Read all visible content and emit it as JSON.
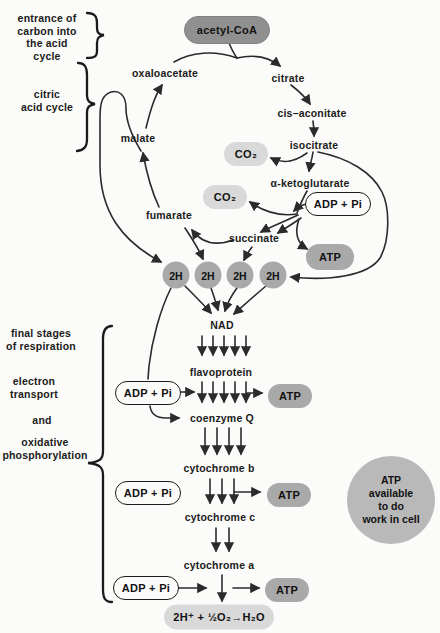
{
  "side": {
    "entrance_label": "entrance of\ncarbon into\nthe acid\ncycle",
    "citric_label": "citric\nacid cycle",
    "final_labels": {
      "final_stages": "final stages\nof respiration",
      "electron": "electron\ntransport",
      "and": "and",
      "oxidative": "oxidative\nphosphorylation"
    }
  },
  "cycle": {
    "acetyl_coa": "acetyl-CoA",
    "oxaloacetate": "oxaloacetate",
    "citrate": "citrate",
    "cis_aconitate": "cis–aconitate",
    "isocitrate": "isocitrate",
    "co2": "CO₂",
    "alpha_ketoglutarate": "α-ketoglutarate",
    "adp_pi": "ADP + Pi",
    "atp": "ATP",
    "fumarate": "fumarate",
    "succinate": "succinate",
    "malate": "malate",
    "h2": "2H"
  },
  "chain": {
    "nad": "NAD",
    "flavoprotein": "flavoprotein",
    "coenzyme_q": "coenzyme Q",
    "cytochrome_b": "cytochrome b",
    "cytochrome_c": "cytochrome c",
    "cytochrome_a": "cytochrome a",
    "adp_pi": "ADP + Pi",
    "atp": "ATP",
    "final_reaction": "2H⁺ + ½O₂→H₂O"
  },
  "atp_circle": "ATP\navailable\nto do\nwork in cell",
  "colors": {
    "background": "#fbfbf9",
    "dark_pill": "#909090",
    "mid_pill": "#a9a9a9",
    "light_pill": "#d9d9d9",
    "line": "#2b2b2b",
    "text": "#1b1b1b"
  }
}
